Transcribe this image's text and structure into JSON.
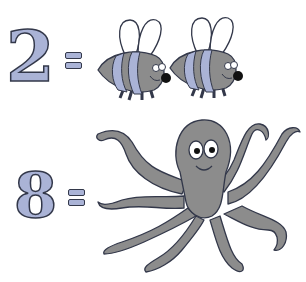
{
  "equations": [
    {
      "number": "2",
      "equals": "=",
      "object": "bee",
      "count": 2
    },
    {
      "number": "8",
      "equals": "=",
      "object": "octopus-legs",
      "count": 8
    }
  ],
  "colors": {
    "number_fill": "#aab3d6",
    "outline": "#33384a",
    "body_gray": "#8c8c8c",
    "stripe_blue": "#aab3d6",
    "wing_white": "#ffffff"
  }
}
